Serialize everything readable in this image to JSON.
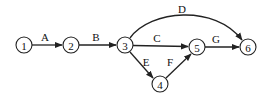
{
  "diagram": {
    "type": "activity-on-arrow network",
    "nodes": [
      {
        "id": "1",
        "label": "1",
        "x": 24,
        "y": 45
      },
      {
        "id": "2",
        "label": "2",
        "x": 71,
        "y": 45
      },
      {
        "id": "3",
        "label": "3",
        "x": 125,
        "y": 45
      },
      {
        "id": "4",
        "label": "4",
        "x": 160,
        "y": 84
      },
      {
        "id": "5",
        "label": "5",
        "x": 197,
        "y": 47
      },
      {
        "id": "6",
        "label": "6",
        "x": 248,
        "y": 47
      }
    ],
    "edges": [
      {
        "label": "A",
        "from": "1",
        "to": "2"
      },
      {
        "label": "B",
        "from": "2",
        "to": "3"
      },
      {
        "label": "C",
        "from": "3",
        "to": "5"
      },
      {
        "label": "D",
        "from": "3",
        "to": "6"
      },
      {
        "label": "E",
        "from": "3",
        "to": "4"
      },
      {
        "label": "F",
        "from": "4",
        "to": "5"
      },
      {
        "label": "G",
        "from": "5",
        "to": "6"
      }
    ],
    "colors": {
      "stroke": "#222222",
      "background": "#ffffff"
    }
  }
}
